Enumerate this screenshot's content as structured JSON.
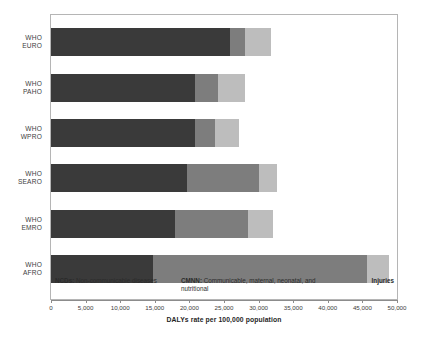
{
  "chart_data": {
    "type": "bar",
    "orientation": "horizontal",
    "stacked": true,
    "title": "",
    "xlabel": "DALYs rate per 100,000 population",
    "ylabel": "",
    "xlim": [
      0,
      50000
    ],
    "grid": false,
    "legend_position": "inside-bottom",
    "categories": [
      "WHO EURO",
      "WHO PAHO",
      "WHO WPRO",
      "WHO SEARO",
      "WHO EMRO",
      "WHO AFRO"
    ],
    "category_lines": [
      {
        "l1": "WHO",
        "l2": "EURO"
      },
      {
        "l1": "WHO",
        "l2": "PAHO"
      },
      {
        "l1": "WHO",
        "l2": "WPRO"
      },
      {
        "l1": "WHO",
        "l2": "SEARO"
      },
      {
        "l1": "WHO",
        "l2": "EMRO"
      },
      {
        "l1": "WHO",
        "l2": "AFRO"
      }
    ],
    "series": [
      {
        "name": "NCDs",
        "color": "#3a3a3a",
        "values": [
          25900,
          20800,
          20800,
          19700,
          17900,
          14800
        ]
      },
      {
        "name": "CMNN",
        "color": "#7d7d7d",
        "values": [
          2200,
          3400,
          2900,
          10400,
          10600,
          30900
        ]
      },
      {
        "name": "Injuries",
        "color": "#bdbdbd",
        "values": [
          3700,
          3800,
          3400,
          2600,
          3600,
          3100
        ]
      }
    ],
    "totals": [
      31800,
      28000,
      27100,
      32700,
      32100,
      48800
    ],
    "xticks": [
      0,
      5000,
      10000,
      15000,
      20000,
      25000,
      30000,
      35000,
      40000,
      45000,
      50000
    ],
    "xtick_labels": [
      "0",
      "5,000",
      "10,000",
      "15,000",
      "20,000",
      "25,000",
      "30,000",
      "35,000",
      "40,000",
      "45,000",
      "50,000"
    ]
  },
  "legend": {
    "ncd_key": "NCDs:",
    "ncd_text": " Non-communicable diseases",
    "cmnn_key": "CMNN:",
    "cmnn_text": " Communicable, maternal, neonatal, and nutritional",
    "injuries": "Injuries"
  },
  "colors": {
    "ncd": "#3a3a3a",
    "cmnn": "#7d7d7d",
    "injuries": "#bdbdbd",
    "frame": "#b5b5b5",
    "axis": "#8c8c8c"
  }
}
